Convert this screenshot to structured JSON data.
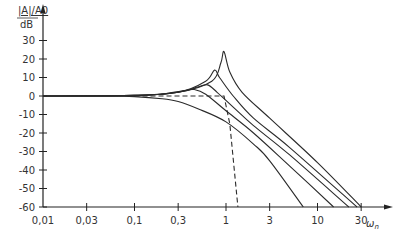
{
  "chart_data": {
    "type": "line",
    "title": "",
    "xlabel": "ω_n",
    "ylabel": "|A|/A_0 dB",
    "ylabel_top": "|A|/A0",
    "ylabel_bottom": "dB",
    "xscale": "log",
    "xlim": [
      0.01,
      30
    ],
    "ylim": [
      -60,
      35
    ],
    "grid": false,
    "legend": "none",
    "x_ticks": [
      "0,01",
      "0,03",
      "0,1",
      "0,3",
      "1",
      "3",
      "10",
      "30"
    ],
    "x_tick_values": [
      0.01,
      0.03,
      0.1,
      0.3,
      1,
      3,
      10,
      30
    ],
    "y_ticks": [
      "30",
      "20",
      "10",
      "0",
      "-10",
      "-20",
      "-30",
      "-40",
      "-50",
      "-60"
    ],
    "y_tick_values": [
      30,
      20,
      10,
      0,
      -10,
      -20,
      -30,
      -40,
      -50,
      -60
    ],
    "series": [
      {
        "name": "curve-1 (overdamped)",
        "style": "solid",
        "x": [
          0.01,
          0.05,
          0.1,
          0.2,
          0.3,
          0.5,
          1,
          2,
          3,
          7
        ],
        "y": [
          0,
          0,
          -0.3,
          -1.5,
          -3,
          -7,
          -14,
          -26,
          -35,
          -60
        ]
      },
      {
        "name": "curve-2",
        "style": "solid",
        "x": [
          0.01,
          0.1,
          0.2,
          0.35,
          0.45,
          0.6,
          1,
          2,
          5,
          15
        ],
        "y": [
          0,
          0.2,
          1,
          3,
          3.5,
          1,
          -8,
          -20,
          -38,
          -60
        ]
      },
      {
        "name": "curve-3",
        "style": "solid",
        "x": [
          0.01,
          0.1,
          0.3,
          0.5,
          0.63,
          0.8,
          1.2,
          2,
          5,
          22
        ],
        "y": [
          0,
          0.3,
          2,
          5,
          6,
          2,
          -6,
          -16,
          -32,
          -60
        ]
      },
      {
        "name": "curve-4",
        "style": "solid",
        "x": [
          0.01,
          0.1,
          0.3,
          0.6,
          0.75,
          0.85,
          1.2,
          2,
          5,
          27
        ],
        "y": [
          0,
          0.3,
          2,
          8,
          14,
          10,
          0,
          -12,
          -28,
          -60
        ]
      },
      {
        "name": "curve-5 (highest resonance)",
        "style": "solid",
        "x": [
          0.01,
          0.1,
          0.3,
          0.7,
          0.88,
          0.95,
          1.1,
          1.5,
          3,
          10,
          30
        ],
        "y": [
          0,
          0.3,
          2,
          8,
          18,
          24,
          13,
          2,
          -12,
          -36,
          -60
        ]
      },
      {
        "name": "ideal low-pass (dashed)",
        "style": "dashed",
        "x": [
          0.1,
          0.95,
          1.1,
          1.35
        ],
        "y": [
          0,
          0,
          -15,
          -60
        ]
      }
    ]
  }
}
